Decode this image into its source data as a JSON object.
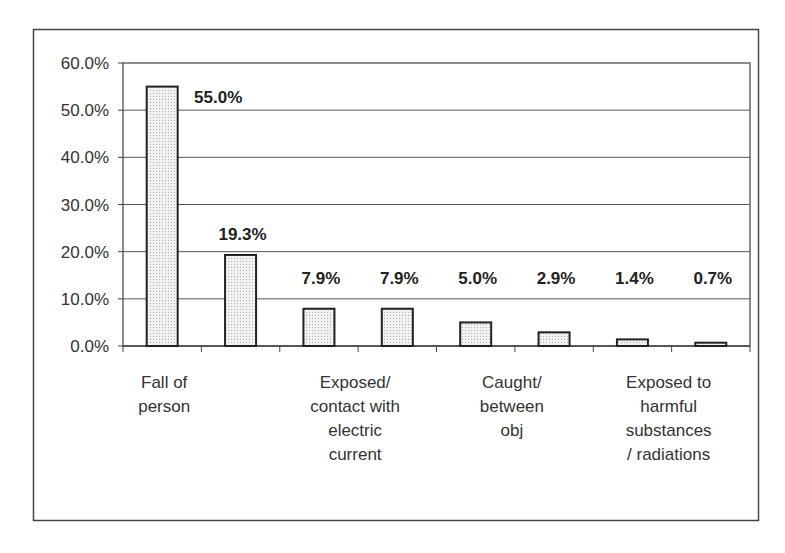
{
  "chart_data": {
    "type": "bar",
    "title": "",
    "xlabel": "",
    "ylabel": "",
    "categories": [
      "Fall of person",
      "",
      "Exposed/ contact with electric current",
      "",
      "Caught/ between obj",
      "",
      "Exposed to harmful substances / radiations",
      ""
    ],
    "category_label_lines": [
      [
        "Fall of",
        "person"
      ],
      [],
      [
        "Exposed/",
        "contact with",
        "electric",
        "current"
      ],
      [],
      [
        "Caught/",
        "between",
        "obj"
      ],
      [],
      [
        "Exposed to",
        "harmful",
        "substances",
        "/ radiations"
      ],
      []
    ],
    "values": [
      55.0,
      19.3,
      7.9,
      7.9,
      5.0,
      2.9,
      1.4,
      0.7
    ],
    "data_labels": [
      "55.0%",
      "19.3%",
      "7.9%",
      "7.9%",
      "5.0%",
      "2.9%",
      "1.4%",
      "0.7%"
    ],
    "ylim": [
      0,
      60
    ],
    "yticks": [
      0,
      10,
      20,
      30,
      40,
      50,
      60
    ],
    "ytick_labels": [
      "0.0%",
      "10.0%",
      "20.0%",
      "30.0%",
      "40.0%",
      "50.0%",
      "60.0%"
    ],
    "grid": true,
    "legend": "none",
    "bar_fill": "dotted light gray",
    "colors": {
      "bar_fill": "#e8e8e8",
      "bar_stroke": "#222222",
      "grid": "#555555"
    }
  }
}
